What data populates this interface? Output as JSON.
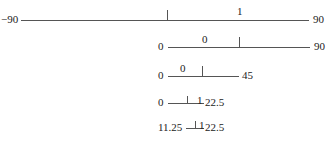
{
  "rows": [
    {
      "left": "−90",
      "right": "90",
      "bit": "1"
    },
    {
      "left": "0",
      "right": "90",
      "bit": "0"
    },
    {
      "left": "0",
      "right": "45",
      "bit": "0"
    },
    {
      "left": "0",
      "right": "22.5",
      "bit": "1"
    },
    {
      "left": "11.25",
      "right": "22.5",
      "bit": "1"
    }
  ]
}
